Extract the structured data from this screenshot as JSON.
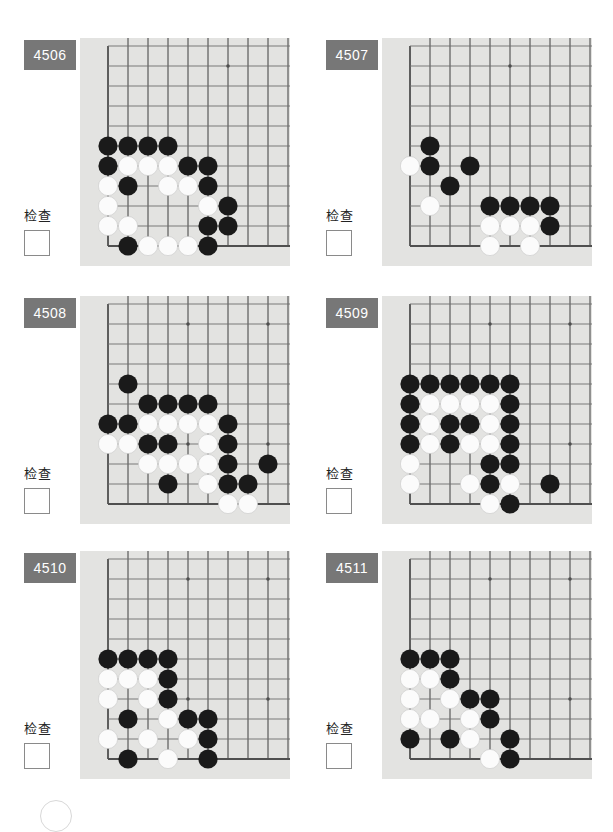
{
  "page": {
    "background_color": "#ffffff",
    "board_color": "#e3e3e1",
    "badge_color": "#777777",
    "grid_line_color": "#6d6d6d",
    "edge_line_color": "#4f4f4f",
    "black_stone_color": "#1a1a1a",
    "white_stone_color": "#fbfbfb",
    "footer_mark": "partial-circle-outline"
  },
  "check_label": "检查",
  "panels": [
    {
      "id": "4506",
      "label": "4506",
      "check_label": "检查",
      "board": {
        "cols": 10,
        "rows": 11,
        "origin_col": 1,
        "origin_row": 0,
        "left_edge_col": 1,
        "bottom_edge_row": 10,
        "star_points": [
          [
            7,
            1
          ],
          [
            7,
            8
          ]
        ],
        "black": [
          [
            1,
            5
          ],
          [
            2,
            5
          ],
          [
            3,
            5
          ],
          [
            4,
            5
          ],
          [
            1,
            6
          ],
          [
            5,
            6
          ],
          [
            6,
            6
          ],
          [
            2,
            7
          ],
          [
            6,
            7
          ],
          [
            7,
            8
          ],
          [
            6,
            9
          ],
          [
            7,
            9
          ],
          [
            2,
            10
          ],
          [
            6,
            10
          ]
        ],
        "white": [
          [
            2,
            6
          ],
          [
            3,
            6
          ],
          [
            4,
            6
          ],
          [
            1,
            7
          ],
          [
            4,
            7
          ],
          [
            5,
            7
          ],
          [
            1,
            8
          ],
          [
            6,
            8
          ],
          [
            1,
            9
          ],
          [
            2,
            9
          ],
          [
            3,
            10
          ],
          [
            4,
            10
          ],
          [
            5,
            10
          ]
        ]
      }
    },
    {
      "id": "4507",
      "label": "4507",
      "check_label": "检查",
      "board": {
        "cols": 10,
        "rows": 11,
        "origin_col": 1,
        "origin_row": 0,
        "left_edge_col": 1,
        "bottom_edge_row": 10,
        "star_points": [
          [
            6,
            1
          ],
          [
            6,
            8
          ]
        ],
        "black": [
          [
            2,
            5
          ],
          [
            2,
            6
          ],
          [
            4,
            6
          ],
          [
            3,
            7
          ],
          [
            5,
            8
          ],
          [
            6,
            8
          ],
          [
            7,
            8
          ],
          [
            8,
            8
          ],
          [
            8,
            9
          ]
        ],
        "white": [
          [
            1,
            6
          ],
          [
            2,
            8
          ],
          [
            5,
            9
          ],
          [
            6,
            9
          ],
          [
            7,
            9
          ],
          [
            5,
            10
          ],
          [
            7,
            10
          ]
        ]
      }
    },
    {
      "id": "4508",
      "label": "4508",
      "check_label": "检查",
      "board": {
        "cols": 10,
        "rows": 11,
        "origin_col": 1,
        "origin_row": 0,
        "left_edge_col": 1,
        "bottom_edge_row": 10,
        "star_points": [
          [
            5,
            1
          ],
          [
            9,
            1
          ],
          [
            5,
            7
          ],
          [
            9,
            7
          ]
        ],
        "black": [
          [
            2,
            4
          ],
          [
            3,
            5
          ],
          [
            4,
            5
          ],
          [
            5,
            5
          ],
          [
            6,
            5
          ],
          [
            1,
            6
          ],
          [
            2,
            6
          ],
          [
            7,
            6
          ],
          [
            3,
            7
          ],
          [
            4,
            7
          ],
          [
            7,
            7
          ],
          [
            7,
            8
          ],
          [
            9,
            8
          ],
          [
            4,
            9
          ],
          [
            7,
            9
          ],
          [
            8,
            9
          ]
        ],
        "white": [
          [
            3,
            6
          ],
          [
            4,
            6
          ],
          [
            5,
            6
          ],
          [
            6,
            6
          ],
          [
            1,
            7
          ],
          [
            2,
            7
          ],
          [
            6,
            7
          ],
          [
            3,
            8
          ],
          [
            4,
            8
          ],
          [
            5,
            8
          ],
          [
            6,
            8
          ],
          [
            6,
            9
          ],
          [
            7,
            10
          ],
          [
            8,
            10
          ]
        ]
      }
    },
    {
      "id": "4509",
      "label": "4509",
      "check_label": "检查",
      "board": {
        "cols": 10,
        "rows": 11,
        "origin_col": 1,
        "origin_row": 0,
        "left_edge_col": 1,
        "bottom_edge_row": 10,
        "star_points": [
          [
            5,
            1
          ],
          [
            9,
            1
          ],
          [
            5,
            7
          ],
          [
            9,
            7
          ]
        ],
        "black": [
          [
            1,
            4
          ],
          [
            2,
            4
          ],
          [
            3,
            4
          ],
          [
            4,
            4
          ],
          [
            5,
            4
          ],
          [
            6,
            4
          ],
          [
            1,
            5
          ],
          [
            6,
            5
          ],
          [
            1,
            6
          ],
          [
            3,
            6
          ],
          [
            4,
            6
          ],
          [
            6,
            6
          ],
          [
            1,
            7
          ],
          [
            3,
            7
          ],
          [
            6,
            7
          ],
          [
            5,
            8
          ],
          [
            6,
            8
          ],
          [
            5,
            9
          ],
          [
            8,
            9
          ],
          [
            6,
            10
          ]
        ],
        "white": [
          [
            2,
            5
          ],
          [
            3,
            5
          ],
          [
            4,
            5
          ],
          [
            5,
            5
          ],
          [
            2,
            6
          ],
          [
            5,
            6
          ],
          [
            2,
            7
          ],
          [
            4,
            7
          ],
          [
            5,
            7
          ],
          [
            1,
            8
          ],
          [
            1,
            9
          ],
          [
            4,
            9
          ],
          [
            6,
            9
          ],
          [
            5,
            10
          ]
        ]
      }
    },
    {
      "id": "4510",
      "label": "4510",
      "check_label": "检查",
      "board": {
        "cols": 10,
        "rows": 11,
        "origin_col": 1,
        "origin_row": 0,
        "left_edge_col": 1,
        "bottom_edge_row": 10,
        "star_points": [
          [
            5,
            1
          ],
          [
            9,
            1
          ],
          [
            5,
            7
          ],
          [
            9,
            7
          ]
        ],
        "black": [
          [
            1,
            5
          ],
          [
            2,
            5
          ],
          [
            3,
            5
          ],
          [
            4,
            5
          ],
          [
            4,
            6
          ],
          [
            4,
            7
          ],
          [
            2,
            8
          ],
          [
            5,
            8
          ],
          [
            6,
            8
          ],
          [
            6,
            9
          ],
          [
            2,
            10
          ],
          [
            6,
            10
          ]
        ],
        "white": [
          [
            1,
            6
          ],
          [
            2,
            6
          ],
          [
            3,
            6
          ],
          [
            1,
            7
          ],
          [
            3,
            7
          ],
          [
            4,
            8
          ],
          [
            1,
            9
          ],
          [
            3,
            9
          ],
          [
            5,
            9
          ],
          [
            4,
            10
          ]
        ]
      }
    },
    {
      "id": "4511",
      "label": "4511",
      "check_label": "检查",
      "board": {
        "cols": 10,
        "rows": 11,
        "origin_col": 1,
        "origin_row": 0,
        "left_edge_col": 1,
        "bottom_edge_row": 10,
        "star_points": [
          [
            5,
            1
          ],
          [
            9,
            1
          ],
          [
            5,
            7
          ],
          [
            9,
            7
          ]
        ],
        "black": [
          [
            1,
            5
          ],
          [
            2,
            5
          ],
          [
            3,
            5
          ],
          [
            3,
            6
          ],
          [
            4,
            7
          ],
          [
            5,
            7
          ],
          [
            5,
            8
          ],
          [
            1,
            9
          ],
          [
            3,
            9
          ],
          [
            6,
            9
          ],
          [
            6,
            10
          ]
        ],
        "white": [
          [
            1,
            6
          ],
          [
            2,
            6
          ],
          [
            1,
            7
          ],
          [
            3,
            7
          ],
          [
            1,
            8
          ],
          [
            2,
            8
          ],
          [
            4,
            8
          ],
          [
            4,
            9
          ],
          [
            5,
            10
          ]
        ]
      }
    }
  ]
}
